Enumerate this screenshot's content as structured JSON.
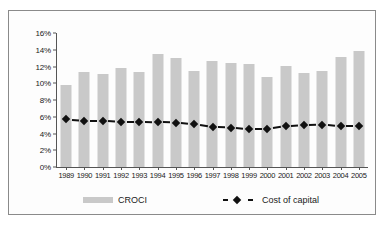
{
  "chart_data": {
    "type": "bar",
    "title": "",
    "subtitle": "",
    "xlabel": "",
    "ylabel": "",
    "categories": [
      "1989",
      "1990",
      "1991",
      "1992",
      "1993",
      "1994",
      "1995",
      "1996",
      "1997",
      "1998",
      "1999",
      "2000",
      "2001",
      "2002",
      "2003",
      "2004",
      "2005"
    ],
    "ylim": [
      0,
      16
    ],
    "ytick_labels": [
      "0%",
      "2%",
      "4%",
      "6%",
      "8%",
      "10%",
      "12%",
      "14%",
      "16%"
    ],
    "ytick_values": [
      0,
      2,
      4,
      6,
      8,
      10,
      12,
      14,
      16
    ],
    "grid": false,
    "legend_position": "bottom",
    "series": [
      {
        "name": "CROCI",
        "type": "bar",
        "color": "#c9c9c9",
        "values": [
          9.85,
          11.3,
          11.1,
          11.8,
          11.4,
          13.5,
          13.0,
          11.5,
          12.65,
          12.4,
          12.25,
          10.8,
          12.1,
          11.2,
          11.45,
          13.15,
          13.8
        ]
      },
      {
        "name": "Cost of capital",
        "type": "line",
        "color": "#111111",
        "marker": "diamond",
        "dash": true,
        "values": [
          5.7,
          5.55,
          5.55,
          5.4,
          5.4,
          5.35,
          5.3,
          5.1,
          4.75,
          4.7,
          4.5,
          4.5,
          4.85,
          5.0,
          5.05,
          4.85,
          4.85
        ]
      }
    ]
  },
  "legend": {
    "croci_label": "CROCI",
    "cost_of_capital_label": "Cost of capital"
  }
}
